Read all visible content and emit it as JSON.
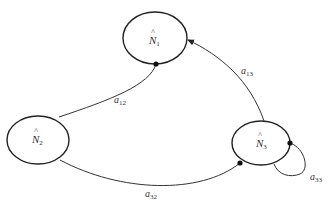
{
  "diagram": {
    "type": "state-transition-graph",
    "nodes": [
      {
        "id": "N1",
        "label": "N",
        "hat": "^",
        "subscript": "1"
      },
      {
        "id": "N2",
        "label": "N",
        "hat": "^",
        "subscript": "2"
      },
      {
        "id": "N3",
        "label": "N",
        "hat": "^",
        "subscript": "3"
      }
    ],
    "edges": [
      {
        "from": "N2",
        "to": "N1",
        "label": "a",
        "subscript": "12"
      },
      {
        "from": "N3",
        "to": "N1",
        "label": "a",
        "subscript": "13"
      },
      {
        "from": "N2",
        "to": "N3",
        "label": "a",
        "subscript": "32"
      },
      {
        "from": "N3",
        "to": "N3",
        "label": "a",
        "subscript": "33"
      }
    ]
  }
}
